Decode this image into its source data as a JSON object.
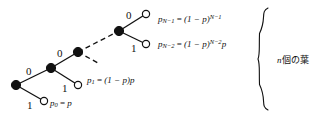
{
  "figure": {
    "background_color": "#ffffff",
    "stroke_color": "#111111",
    "node_fill_internal": "#111111",
    "node_fill_leaf": "#ffffff"
  },
  "edge_labels": [
    {
      "id": "root-zero",
      "text": "0",
      "x": 26,
      "y": 66
    },
    {
      "id": "root-one",
      "text": "1",
      "x": 27,
      "y": 100
    },
    {
      "id": "level2-zero",
      "text": "0",
      "x": 57,
      "y": 48
    },
    {
      "id": "level2-one",
      "text": "1",
      "x": 62,
      "y": 83
    },
    {
      "id": "levelN-zero",
      "text": "0",
      "x": 126,
      "y": 10
    },
    {
      "id": "levelN-one",
      "text": "1",
      "x": 131,
      "y": 43
    }
  ],
  "formulas": [
    {
      "id": "p-n-minus-1",
      "x": 158,
      "y": 12,
      "p": "p",
      "sub": "N−1",
      "eq": "=",
      "body": "(1 − p)",
      "sup": "N−1",
      "tail": ""
    },
    {
      "id": "p-n-minus-2",
      "x": 158,
      "y": 37,
      "p": "p",
      "sub": "N−2",
      "eq": "=",
      "body": "(1 − p)",
      "sup": "N−2",
      "tail": "p"
    },
    {
      "id": "p-one",
      "x": 87,
      "y": 75,
      "p": "p",
      "sub": "1",
      "eq": "=",
      "body": "(1 − p)p",
      "sup": "",
      "tail": ""
    },
    {
      "id": "p-zero",
      "x": 50,
      "y": 98,
      "p": "p",
      "sub": "0",
      "eq": "=",
      "body": "p",
      "sup": "",
      "tail": ""
    }
  ],
  "brace": {
    "label_prefix": "n",
    "label_text": "個の葉",
    "label_x": 277,
    "label_y": 55
  },
  "nodes": {
    "internal": [
      {
        "id": "root",
        "cx": 16,
        "cy": 85,
        "r": 4.6
      },
      {
        "id": "level2",
        "cx": 51,
        "cy": 68,
        "r": 4.6
      },
      {
        "id": "level3",
        "cx": 78,
        "cy": 52,
        "r": 4.6
      },
      {
        "id": "levelN",
        "cx": 119,
        "cy": 31,
        "r": 4.6
      }
    ],
    "leaves": [
      {
        "id": "leaf-p0",
        "cx": 44,
        "cy": 101,
        "r": 3.6
      },
      {
        "id": "leaf-p1",
        "cx": 78,
        "cy": 85,
        "r": 3.6
      },
      {
        "id": "leaf-pn2",
        "cx": 146,
        "cy": 44,
        "r": 3.6
      },
      {
        "id": "leaf-pn1",
        "cx": 146,
        "cy": 14,
        "r": 3.6
      }
    ]
  },
  "edges": {
    "solid": [
      {
        "id": "root-to-level2",
        "x1": 16,
        "y1": 85,
        "x2": 51,
        "y2": 68
      },
      {
        "id": "root-to-leaf-p0",
        "x1": 16,
        "y1": 85,
        "x2": 44,
        "y2": 101
      },
      {
        "id": "level2-to-level3",
        "x1": 51,
        "y1": 68,
        "x2": 78,
        "y2": 52
      },
      {
        "id": "level2-to-leaf-p1",
        "x1": 51,
        "y1": 68,
        "x2": 78,
        "y2": 85
      },
      {
        "id": "leveln-to-leaf-pn1",
        "x1": 119,
        "y1": 31,
        "x2": 146,
        "y2": 14
      },
      {
        "id": "leveln-to-leaf-pn2",
        "x1": 119,
        "y1": 31,
        "x2": 146,
        "y2": 44
      }
    ],
    "dashed": [
      {
        "id": "level3-to-leveln",
        "x1": 78,
        "y1": 52,
        "x2": 119,
        "y2": 31
      },
      {
        "id": "level3-stub-down",
        "x1": 78,
        "y1": 52,
        "x2": 98,
        "y2": 63
      }
    ]
  }
}
